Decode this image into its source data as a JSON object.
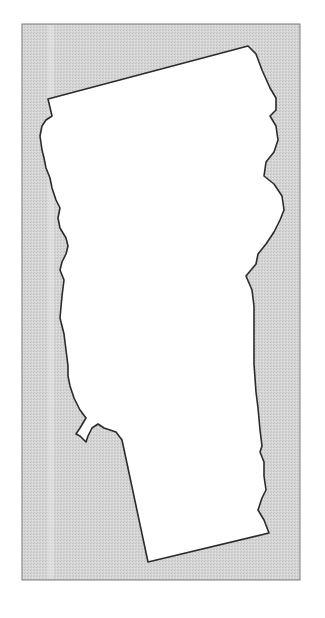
{
  "map": {
    "region": "Vermont state outline",
    "colors": {
      "page_background": "#ffffff",
      "frame_fill": "#d3d3d3",
      "frame_stroke": "#7a7a7a",
      "stripe": "#e6e6e6",
      "state_fill": "#ffffff",
      "state_stroke": "#2b2b2b"
    },
    "frame": {
      "x": 22,
      "y": 24,
      "width": 278,
      "height": 556
    },
    "outline_points": "48,99 248,46 256,54 262,70 270,88 276,98 276,110 270,116 276,126 278,140 274,152 266,162 264,176 274,184 282,196 284,210 280,220 274,232 266,244 258,254 256,264 246,276 252,290 254,306 254,330 254,364 256,392 258,408 260,430 262,446 260,452 264,462 264,476 266,490 262,498 258,510 264,520 269,533 148,562 122,440 116,432 104,428 98,424 92,428 88,436 86,442 80,436 76,434 80,428 86,418 80,410 74,398 70,386 68,376 68,366 66,350 64,334 60,318 62,296 64,280 60,270 62,262 66,254 68,246 66,238 60,228 58,218 60,208 56,200 52,188 50,178 46,168 44,158 42,150 40,136 42,126 46,120 52,116 48,99"
  }
}
